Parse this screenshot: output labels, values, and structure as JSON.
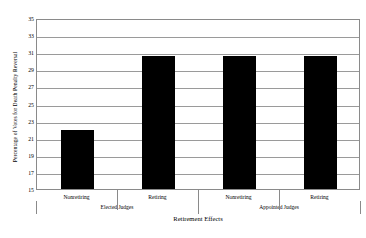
{
  "chart_data": {
    "type": "bar",
    "title": "",
    "xlabel": "Retirement Effects",
    "ylabel": "Percentage of Votes for Death Penalty Reversal",
    "categories": [
      "Nonretiring",
      "Retiring",
      "Nonretiring",
      "Retiring"
    ],
    "values": [
      21.9,
      30.6,
      30.6,
      30.5
    ],
    "groups": [
      {
        "label": "Elected Judges",
        "categories": [
          "Nonretiring",
          "Retiring"
        ]
      },
      {
        "label": "Appointed Judges",
        "categories": [
          "Nonretiring",
          "Retiring"
        ]
      }
    ],
    "ylim": [
      15,
      35
    ],
    "yticks": [
      15,
      17,
      19,
      21,
      23,
      25,
      27,
      29,
      31,
      33,
      35
    ],
    "grid": true,
    "legend": "none",
    "bar_color": "#000000",
    "frame_color": "#8a8a8a",
    "background": "#ffffff"
  },
  "axis": {
    "y_tick_labels": [
      "35",
      "33",
      "31",
      "29",
      "27",
      "25",
      "23",
      "21",
      "19",
      "17",
      "15"
    ],
    "y_title": "Percentage of Votes for Death Penalty Reversal",
    "x_title": "Retirement Effects",
    "x_tick_labels": [
      "Nonretiring",
      "Retiring",
      "Nonretiring",
      "Retiring"
    ],
    "group_labels": [
      "Elected Judges",
      "Appointed Judges"
    ]
  }
}
